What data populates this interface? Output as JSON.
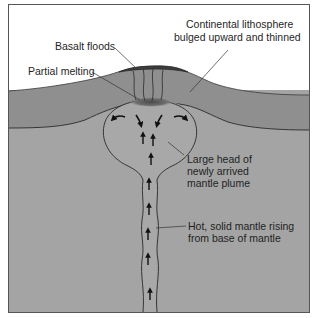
{
  "diagram": {
    "type": "cross-section",
    "colors": {
      "sky": "#ffffff",
      "lithosphere": "#8f8f8f",
      "mantle": "#a4a4a4",
      "plume": "#a9a9a9",
      "melt_zone": "#5a5a5a",
      "basalt": "#4d4d4d",
      "outline": "#2a2a2a",
      "frame": "#555555"
    },
    "labels": {
      "lithosphere_line1": "Continental lithosphere",
      "lithosphere_line2": "bulged upward and thinned",
      "basalt": "Basalt floods",
      "melting": "Partial melting",
      "head_line1": "Large head of",
      "head_line2": "newly arrived",
      "head_line3": "mantle plume",
      "stem_line1": "Hot, solid mantle rising",
      "stem_line2": "from base of mantle"
    },
    "arrows": {
      "head_flow": 4,
      "upward_in_head": 3,
      "upward_in_stem": 6
    }
  }
}
